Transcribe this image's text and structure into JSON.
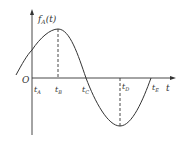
{
  "diagram": {
    "title": "",
    "y_axis": {
      "label": "f",
      "label_sub": "A",
      "label_arg": "(t)"
    },
    "x_axis": {
      "label": "t"
    },
    "origin_label": "O",
    "ticks": [
      {
        "name": "A",
        "label": "t",
        "sub": "A"
      },
      {
        "name": "B",
        "label": "t",
        "sub": "B"
      },
      {
        "name": "C",
        "label": "t",
        "sub": "C"
      },
      {
        "name": "D",
        "label": "t",
        "sub": "D"
      },
      {
        "name": "E",
        "label": "t",
        "sub": "E"
      }
    ],
    "curve": "sinusoid: rises from negative, crosses y-axis above zero, max at tB, crosses zero at tC, min at tD, returns to zero at tE",
    "colors": {
      "line": "#333333"
    }
  }
}
